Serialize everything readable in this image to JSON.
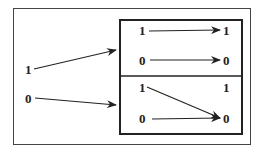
{
  "diagram": {
    "inputs": [
      {
        "label": "1",
        "x": 25,
        "y": 74
      },
      {
        "label": "0",
        "x": 25,
        "y": 103
      }
    ],
    "top_box": {
      "left_labels": [
        {
          "label": "1",
          "x": 142,
          "y": 35
        },
        {
          "label": "0",
          "x": 142,
          "y": 64
        }
      ],
      "right_labels": [
        {
          "label": "1",
          "x": 225,
          "y": 35
        },
        {
          "label": "0",
          "x": 225,
          "y": 64
        }
      ]
    },
    "bottom_box": {
      "left_labels": [
        {
          "label": "1",
          "x": 142,
          "y": 92
        },
        {
          "label": "0",
          "x": 142,
          "y": 123
        }
      ],
      "right_labels": [
        {
          "label": "1",
          "x": 225,
          "y": 92
        },
        {
          "label": "0",
          "x": 225,
          "y": 123
        }
      ]
    },
    "colors": {
      "stroke": "#222222",
      "background": "#ffffff"
    }
  }
}
